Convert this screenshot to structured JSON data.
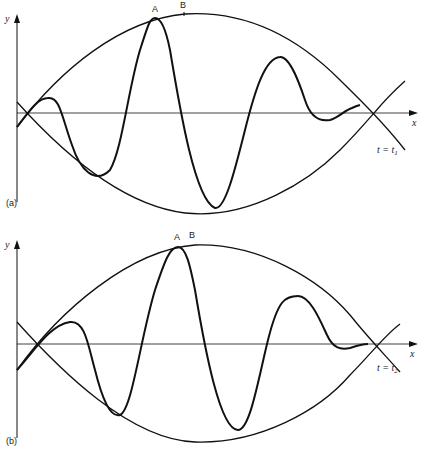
{
  "panels": [
    {
      "id": "a",
      "panel_label": "(a)",
      "y_axis_label": "y",
      "x_axis_label": "x",
      "point_a_label": "A",
      "point_b_label": "B",
      "time_label_prefix": "t = t",
      "time_label_sub": "1"
    },
    {
      "id": "b",
      "panel_label": "(b)",
      "y_axis_label": "y",
      "x_axis_label": "x",
      "point_a_label": "A",
      "point_b_label": "B",
      "time_label_prefix": "t = t",
      "time_label_sub": "2"
    }
  ],
  "colors": {
    "stroke": "#111111",
    "background": "#ffffff"
  }
}
